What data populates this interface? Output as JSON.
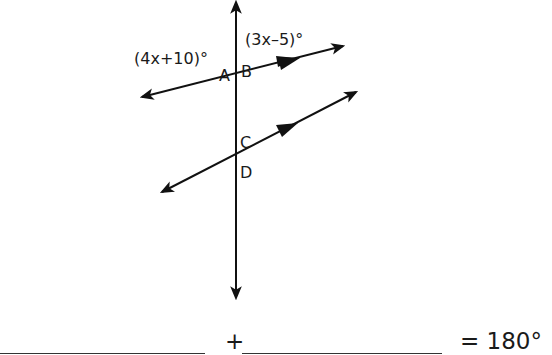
{
  "diagram": {
    "angle_expressions": {
      "left": "(4x+10)°",
      "right": "(3x–5)°"
    },
    "angle_labels": [
      "A",
      "B",
      "C",
      "D"
    ],
    "equation": {
      "plus": "+",
      "result": "= 180°"
    },
    "colors": {
      "line": "#111111",
      "background": "#ffffff"
    }
  }
}
